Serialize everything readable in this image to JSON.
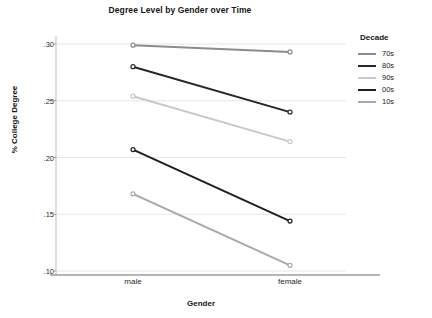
{
  "chart_data": {
    "type": "line",
    "title": "Degree Level by Gender over Time",
    "xlabel": "Gender",
    "ylabel": "% College Degree",
    "categories": [
      "male",
      "female"
    ],
    "ylim": [
      0.095,
      0.305
    ],
    "yticks": [
      ".30",
      ".25",
      ".20",
      ".15",
      ".10"
    ],
    "ytick_values": [
      0.3,
      0.25,
      0.2,
      0.15,
      0.1
    ],
    "grid": true,
    "legend_position": "right",
    "legend_title": "Decade",
    "series": [
      {
        "name": "70s",
        "values": [
          0.299,
          0.293
        ],
        "color": "#8c8c8c"
      },
      {
        "name": "80s",
        "values": [
          0.28,
          0.24
        ],
        "color": "#272727"
      },
      {
        "name": "90s",
        "values": [
          0.254,
          0.214
        ],
        "color": "#c8c8c8"
      },
      {
        "name": "00s",
        "values": [
          0.207,
          0.144
        ],
        "color": "#1f1f1f"
      },
      {
        "name": "10s",
        "values": [
          0.168,
          0.105
        ],
        "color": "#a8a8a8"
      }
    ]
  },
  "title": "Degree Level by Gender over Time",
  "axes": {
    "x_title": "Gender",
    "y_title": "% College Degree",
    "x_categories": [
      "male",
      "female"
    ],
    "y_ticks": [
      ".30",
      ".25",
      ".20",
      ".15",
      ".10"
    ]
  },
  "legend": {
    "title": "Decade",
    "items": [
      {
        "label": "70s"
      },
      {
        "label": "80s"
      },
      {
        "label": "90s"
      },
      {
        "label": "00s"
      },
      {
        "label": "10s"
      }
    ]
  }
}
